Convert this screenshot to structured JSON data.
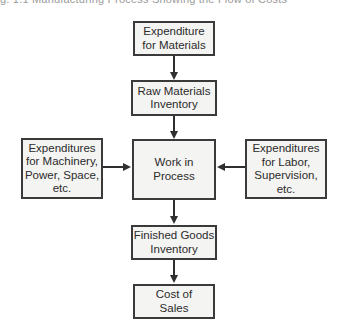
{
  "caption": "g. 1.1   Manufacturing Process Showing the Flow of Costs",
  "nodes": {
    "materials": {
      "label": "Expenditure\nfor Materials"
    },
    "raw_inventory": {
      "label": "Raw Materials\nInventory"
    },
    "wip": {
      "label": "Work in\nProcess"
    },
    "machinery": {
      "label": "Expenditures\nfor Machinery,\nPower, Space,\netc."
    },
    "labor": {
      "label": "Expenditures\nfor Labor,\nSupervision,\netc."
    },
    "finished_goods": {
      "label": "Finished Goods\nInventory"
    },
    "cost_of_sales": {
      "label": "Cost of\nSales"
    }
  },
  "edges": [
    {
      "from": "materials",
      "to": "raw_inventory"
    },
    {
      "from": "raw_inventory",
      "to": "wip"
    },
    {
      "from": "machinery",
      "to": "wip"
    },
    {
      "from": "labor",
      "to": "wip"
    },
    {
      "from": "wip",
      "to": "finished_goods"
    },
    {
      "from": "finished_goods",
      "to": "cost_of_sales"
    }
  ],
  "colors": {
    "border": "#3a3a3a",
    "box_fill": "#f4f4f2",
    "arrow": "#2f2f2f"
  }
}
